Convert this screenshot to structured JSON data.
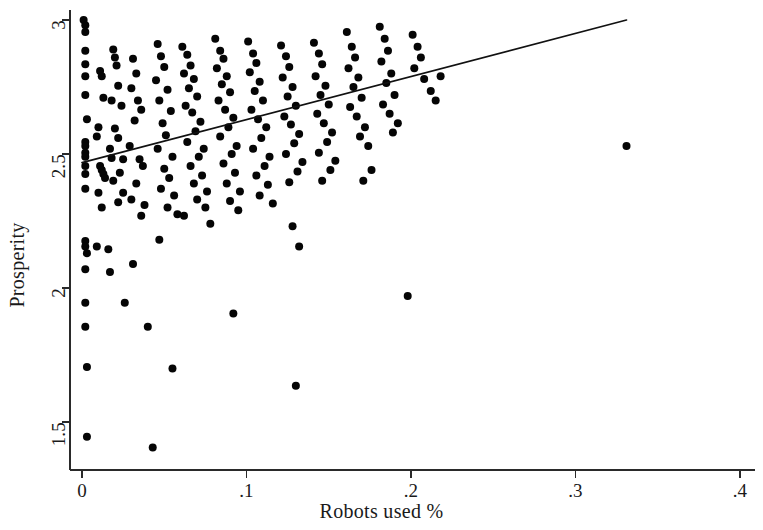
{
  "chart_data": {
    "type": "scatter",
    "title": "",
    "xlabel": "Robots used %",
    "ylabel": "Prosperity",
    "xlim": [
      0.0,
      0.4
    ],
    "ylim": [
      1.38,
      3.02
    ],
    "grid": false,
    "legend": null,
    "xticks": [
      0,
      0.1,
      0.2,
      0.3,
      0.4
    ],
    "xticklabels": [
      "0",
      ".1",
      ".2",
      ".3",
      ".4"
    ],
    "yticks": [
      1.5,
      2,
      2.5,
      3
    ],
    "yticklabels": [
      "1.5",
      "2",
      "2.5",
      "3"
    ],
    "marker": {
      "shape": "circle",
      "color": "#050505",
      "size_px": 8
    },
    "fit_line": {
      "label": "linear fit",
      "color": "#111111",
      "x_start": 0.0,
      "y_start": 2.468,
      "x_end": 0.331,
      "y_end": 3.0
    },
    "points": [
      [
        0.001,
        3.0
      ],
      [
        0.002,
        2.98
      ],
      [
        0.002,
        2.955
      ],
      [
        0.002,
        2.885
      ],
      [
        0.002,
        2.835
      ],
      [
        0.002,
        2.79
      ],
      [
        0.002,
        2.72
      ],
      [
        0.003,
        2.63
      ],
      [
        0.002,
        2.545
      ],
      [
        0.002,
        2.53
      ],
      [
        0.002,
        2.505
      ],
      [
        0.002,
        2.49
      ],
      [
        0.002,
        2.455
      ],
      [
        0.002,
        2.425
      ],
      [
        0.002,
        2.37
      ],
      [
        0.002,
        2.175
      ],
      [
        0.002,
        2.155
      ],
      [
        0.003,
        2.13
      ],
      [
        0.002,
        2.07
      ],
      [
        0.002,
        1.945
      ],
      [
        0.002,
        1.855
      ],
      [
        0.003,
        1.705
      ],
      [
        0.003,
        1.445
      ],
      [
        0.011,
        2.81
      ],
      [
        0.012,
        2.79
      ],
      [
        0.013,
        2.71
      ],
      [
        0.01,
        2.6
      ],
      [
        0.009,
        2.565
      ],
      [
        0.011,
        2.455
      ],
      [
        0.012,
        2.44
      ],
      [
        0.013,
        2.425
      ],
      [
        0.014,
        2.41
      ],
      [
        0.01,
        2.355
      ],
      [
        0.012,
        2.3
      ],
      [
        0.009,
        2.155
      ],
      [
        0.016,
        2.145
      ],
      [
        0.017,
        2.52
      ],
      [
        0.018,
        2.485
      ],
      [
        0.019,
        2.89
      ],
      [
        0.02,
        2.86
      ],
      [
        0.021,
        2.83
      ],
      [
        0.022,
        2.755
      ],
      [
        0.018,
        2.7
      ],
      [
        0.024,
        2.68
      ],
      [
        0.02,
        2.595
      ],
      [
        0.022,
        2.56
      ],
      [
        0.025,
        2.48
      ],
      [
        0.023,
        2.43
      ],
      [
        0.019,
        2.4
      ],
      [
        0.025,
        2.355
      ],
      [
        0.022,
        2.32
      ],
      [
        0.017,
        2.06
      ],
      [
        0.026,
        1.945
      ],
      [
        0.031,
        2.855
      ],
      [
        0.033,
        2.8
      ],
      [
        0.03,
        2.745
      ],
      [
        0.034,
        2.7
      ],
      [
        0.036,
        2.665
      ],
      [
        0.032,
        2.625
      ],
      [
        0.029,
        2.53
      ],
      [
        0.035,
        2.48
      ],
      [
        0.037,
        2.455
      ],
      [
        0.033,
        2.39
      ],
      [
        0.03,
        2.33
      ],
      [
        0.038,
        2.31
      ],
      [
        0.036,
        2.27
      ],
      [
        0.031,
        2.09
      ],
      [
        0.04,
        1.855
      ],
      [
        0.043,
        1.405
      ],
      [
        0.046,
        2.91
      ],
      [
        0.048,
        2.865
      ],
      [
        0.05,
        2.825
      ],
      [
        0.045,
        2.775
      ],
      [
        0.052,
        2.74
      ],
      [
        0.047,
        2.7
      ],
      [
        0.054,
        2.66
      ],
      [
        0.049,
        2.615
      ],
      [
        0.051,
        2.57
      ],
      [
        0.046,
        2.52
      ],
      [
        0.055,
        2.49
      ],
      [
        0.05,
        2.445
      ],
      [
        0.053,
        2.41
      ],
      [
        0.048,
        2.37
      ],
      [
        0.056,
        2.345
      ],
      [
        0.052,
        2.3
      ],
      [
        0.058,
        2.275
      ],
      [
        0.047,
        2.18
      ],
      [
        0.055,
        1.7
      ],
      [
        0.061,
        2.9
      ],
      [
        0.064,
        2.87
      ],
      [
        0.066,
        2.83
      ],
      [
        0.062,
        2.8
      ],
      [
        0.068,
        2.78
      ],
      [
        0.065,
        2.745
      ],
      [
        0.07,
        2.715
      ],
      [
        0.063,
        2.68
      ],
      [
        0.067,
        2.655
      ],
      [
        0.072,
        2.62
      ],
      [
        0.069,
        2.585
      ],
      [
        0.064,
        2.545
      ],
      [
        0.074,
        2.52
      ],
      [
        0.071,
        2.49
      ],
      [
        0.066,
        2.455
      ],
      [
        0.073,
        2.42
      ],
      [
        0.068,
        2.39
      ],
      [
        0.076,
        2.36
      ],
      [
        0.07,
        2.33
      ],
      [
        0.075,
        2.3
      ],
      [
        0.062,
        2.27
      ],
      [
        0.078,
        2.24
      ],
      [
        0.081,
        2.93
      ],
      [
        0.084,
        2.885
      ],
      [
        0.086,
        2.855
      ],
      [
        0.082,
        2.82
      ],
      [
        0.088,
        2.79
      ],
      [
        0.085,
        2.76
      ],
      [
        0.09,
        2.73
      ],
      [
        0.083,
        2.7
      ],
      [
        0.087,
        2.665
      ],
      [
        0.092,
        2.635
      ],
      [
        0.089,
        2.6
      ],
      [
        0.084,
        2.565
      ],
      [
        0.094,
        2.53
      ],
      [
        0.091,
        2.5
      ],
      [
        0.086,
        2.465
      ],
      [
        0.093,
        2.43
      ],
      [
        0.088,
        2.39
      ],
      [
        0.096,
        2.36
      ],
      [
        0.09,
        2.325
      ],
      [
        0.095,
        2.29
      ],
      [
        0.092,
        1.905
      ],
      [
        0.101,
        2.92
      ],
      [
        0.104,
        2.875
      ],
      [
        0.106,
        2.84
      ],
      [
        0.102,
        2.805
      ],
      [
        0.108,
        2.77
      ],
      [
        0.105,
        2.735
      ],
      [
        0.11,
        2.7
      ],
      [
        0.103,
        2.665
      ],
      [
        0.107,
        2.63
      ],
      [
        0.112,
        2.6
      ],
      [
        0.109,
        2.56
      ],
      [
        0.104,
        2.52
      ],
      [
        0.114,
        2.49
      ],
      [
        0.111,
        2.455
      ],
      [
        0.106,
        2.42
      ],
      [
        0.113,
        2.385
      ],
      [
        0.108,
        2.345
      ],
      [
        0.116,
        2.315
      ],
      [
        0.121,
        2.905
      ],
      [
        0.124,
        2.865
      ],
      [
        0.126,
        2.825
      ],
      [
        0.122,
        2.785
      ],
      [
        0.128,
        2.75
      ],
      [
        0.125,
        2.715
      ],
      [
        0.13,
        2.68
      ],
      [
        0.123,
        2.64
      ],
      [
        0.127,
        2.61
      ],
      [
        0.132,
        2.575
      ],
      [
        0.129,
        2.54
      ],
      [
        0.124,
        2.5
      ],
      [
        0.134,
        2.47
      ],
      [
        0.131,
        2.435
      ],
      [
        0.126,
        2.395
      ],
      [
        0.128,
        2.23
      ],
      [
        0.132,
        2.155
      ],
      [
        0.13,
        1.635
      ],
      [
        0.141,
        2.915
      ],
      [
        0.144,
        2.875
      ],
      [
        0.146,
        2.835
      ],
      [
        0.142,
        2.79
      ],
      [
        0.148,
        2.755
      ],
      [
        0.145,
        2.72
      ],
      [
        0.15,
        2.685
      ],
      [
        0.143,
        2.65
      ],
      [
        0.147,
        2.615
      ],
      [
        0.152,
        2.58
      ],
      [
        0.149,
        2.545
      ],
      [
        0.144,
        2.505
      ],
      [
        0.154,
        2.475
      ],
      [
        0.151,
        2.44
      ],
      [
        0.146,
        2.4
      ],
      [
        0.161,
        2.955
      ],
      [
        0.164,
        2.9
      ],
      [
        0.166,
        2.86
      ],
      [
        0.162,
        2.82
      ],
      [
        0.168,
        2.785
      ],
      [
        0.165,
        2.75
      ],
      [
        0.17,
        2.71
      ],
      [
        0.163,
        2.675
      ],
      [
        0.167,
        2.64
      ],
      [
        0.172,
        2.6
      ],
      [
        0.169,
        2.565
      ],
      [
        0.174,
        2.53
      ],
      [
        0.176,
        2.44
      ],
      [
        0.171,
        2.4
      ],
      [
        0.181,
        2.975
      ],
      [
        0.184,
        2.93
      ],
      [
        0.186,
        2.885
      ],
      [
        0.182,
        2.845
      ],
      [
        0.188,
        2.8
      ],
      [
        0.185,
        2.765
      ],
      [
        0.19,
        2.72
      ],
      [
        0.183,
        2.685
      ],
      [
        0.187,
        2.65
      ],
      [
        0.192,
        2.615
      ],
      [
        0.189,
        2.58
      ],
      [
        0.198,
        1.97
      ],
      [
        0.201,
        2.945
      ],
      [
        0.204,
        2.9
      ],
      [
        0.206,
        2.86
      ],
      [
        0.202,
        2.82
      ],
      [
        0.208,
        2.78
      ],
      [
        0.212,
        2.735
      ],
      [
        0.215,
        2.7
      ],
      [
        0.218,
        2.79
      ],
      [
        0.331,
        2.53
      ]
    ]
  },
  "axes": {
    "x_axis_name": "robots-used-percent",
    "y_axis_name": "prosperity"
  }
}
